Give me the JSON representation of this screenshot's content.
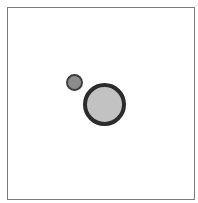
{
  "diagram": {
    "frame": {
      "border_color": "#7a7a7a",
      "background": "#ffffff"
    },
    "circles": [
      {
        "id": "small",
        "center": [
          74,
          82
        ],
        "radius": 8,
        "fill": "#8c8c8c",
        "stroke": "#3e3e3e"
      },
      {
        "id": "large",
        "center": [
          104,
          104
        ],
        "radius": 21,
        "fill": "#c2c2c2",
        "stroke": "#2c2c2c"
      }
    ]
  }
}
